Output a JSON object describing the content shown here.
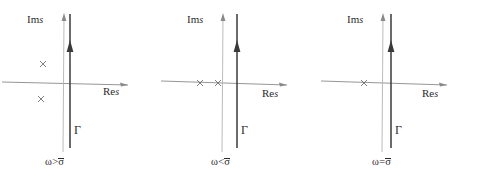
{
  "figure": {
    "background": "#ffffff",
    "axis_color": "#8a8a8a",
    "contour_color": "#3a3a3a",
    "pole_color": "#6f6f6f",
    "text_color": "#2b2b2b",
    "width": 478,
    "height": 188
  },
  "labels": {
    "im_axis_prefix": "Im",
    "im_axis_var": "s",
    "re_axis_prefix": "Re",
    "re_axis_var": "s",
    "contour": "Γ",
    "pole_marker": "×"
  },
  "panels": [
    {
      "id": "panel-omega-gt-sigma",
      "caption_omega": "ω",
      "caption_rel": ">",
      "caption_sigma": "σ",
      "caption": "ω>σ̄",
      "im_label": "Im s",
      "re_label": "Re s",
      "contour_label": "Γ",
      "poles": [
        {
          "name": "pole-upper-left",
          "re": -0.55,
          "im": 0.42
        },
        {
          "name": "pole-lower-left",
          "re": -0.55,
          "im": -0.4
        }
      ],
      "pole_count": 2,
      "pole_placement": "complex-conjugate-pair-left-of-contour"
    },
    {
      "id": "panel-omega-lt-sigma",
      "caption_omega": "ω",
      "caption_rel": "<",
      "caption_sigma": "σ",
      "caption": "ω<σ̄",
      "im_label": "Im s",
      "re_label": "Re s",
      "contour_label": "Γ",
      "poles": [
        {
          "name": "pole-real-outer",
          "re": -1.05,
          "im": 0.0
        },
        {
          "name": "pole-real-inner",
          "re": -0.62,
          "im": 0.0
        }
      ],
      "pole_count": 2,
      "pole_placement": "two-real-poles-on-negative-real-axis"
    },
    {
      "id": "panel-omega-eq-sigma",
      "caption_omega": "ω",
      "caption_rel": "=",
      "caption_sigma": "σ",
      "caption": "ω=σ̄",
      "im_label": "Im s",
      "re_label": "Re s",
      "contour_label": "Γ",
      "poles": [
        {
          "name": "pole-real-double",
          "re": -0.75,
          "im": 0.0
        }
      ],
      "pole_count": 1,
      "pole_placement": "single-double-pole-on-negative-real-axis"
    }
  ]
}
